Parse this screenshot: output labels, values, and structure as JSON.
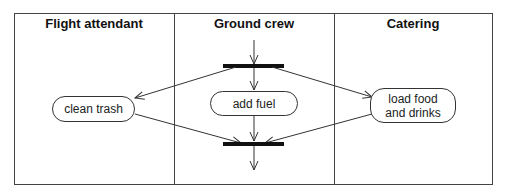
{
  "diagram": {
    "type": "UML activity diagram (swimlanes)",
    "lanes": [
      {
        "id": "lane-1",
        "title": "Flight attendant"
      },
      {
        "id": "lane-2",
        "title": "Ground crew"
      },
      {
        "id": "lane-3",
        "title": "Catering"
      }
    ],
    "activities": [
      {
        "id": "a1",
        "label": "clean trash",
        "lane": "Flight attendant"
      },
      {
        "id": "a2",
        "label": "add fuel",
        "lane": "Ground crew"
      },
      {
        "id": "a3",
        "label": "load food and drinks",
        "line1": "load food",
        "line2": "and drinks",
        "lane": "Catering"
      }
    ],
    "bars": [
      {
        "id": "fork",
        "kind": "fork"
      },
      {
        "id": "join",
        "kind": "join"
      }
    ],
    "edges": [
      {
        "from": "start",
        "to": "fork"
      },
      {
        "from": "fork",
        "to": "clean trash"
      },
      {
        "from": "fork",
        "to": "add fuel"
      },
      {
        "from": "fork",
        "to": "load food and drinks"
      },
      {
        "from": "clean trash",
        "to": "join"
      },
      {
        "from": "add fuel",
        "to": "join"
      },
      {
        "from": "load food and drinks",
        "to": "join"
      },
      {
        "from": "join",
        "to": "end"
      }
    ],
    "colors": {
      "line": "#333333",
      "bar": "#111111",
      "background": "#ffffff"
    }
  }
}
